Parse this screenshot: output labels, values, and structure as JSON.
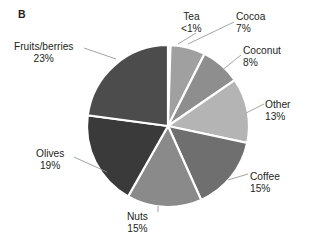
{
  "figure": {
    "panel_letter": "B"
  },
  "chart_data": {
    "type": "pie",
    "title": "",
    "xlabel": "",
    "ylabel": "",
    "legend": "none",
    "grid": false,
    "start_angle_deg": 0,
    "direction": "clockwise",
    "labels_outside": true,
    "categories": [
      "Tea",
      "Cocoa",
      "Coconut",
      "Other",
      "Coffee",
      "Nuts",
      "Olives",
      "Fruits/berries"
    ],
    "values": [
      0.5,
      7,
      8,
      13,
      15,
      15,
      19,
      23
    ],
    "value_labels": [
      "<1%",
      "7%",
      "8%",
      "13%",
      "15%",
      "15%",
      "19%",
      "23%"
    ],
    "slice_colors": [
      "#9c9c9c",
      "#a0a0a0",
      "#8e8e8e",
      "#b4b4b4",
      "#6f6f6f",
      "#8a8a8a",
      "#3a3a3a",
      "#4c4c4c"
    ],
    "slices": [
      {
        "name": "Tea",
        "value_label": "<1%",
        "percent": 0.5,
        "color": "#9c9c9c"
      },
      {
        "name": "Cocoa",
        "value_label": "7%",
        "percent": 7,
        "color": "#a0a0a0"
      },
      {
        "name": "Coconut",
        "value_label": "8%",
        "percent": 8,
        "color": "#8e8e8e"
      },
      {
        "name": "Other",
        "value_label": "13%",
        "percent": 13,
        "color": "#b4b4b4"
      },
      {
        "name": "Coffee",
        "value_label": "15%",
        "percent": 15,
        "color": "#6f6f6f"
      },
      {
        "name": "Nuts",
        "value_label": "15%",
        "percent": 15,
        "color": "#8a8a8a"
      },
      {
        "name": "Olives",
        "value_label": "19%",
        "percent": 19,
        "color": "#3a3a3a"
      },
      {
        "name": "Fruits/berries",
        "value_label": "23%",
        "percent": 23,
        "color": "#4c4c4c"
      }
    ],
    "slice_edge_color": "#ffffff",
    "leader_line_color": "#8d8d8d",
    "text_color": "#231f20"
  }
}
